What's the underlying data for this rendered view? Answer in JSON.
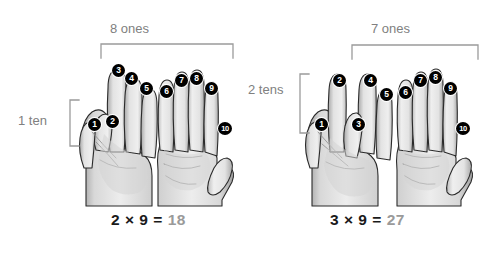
{
  "figure": {
    "background": "#ffffff",
    "label_color": "#808080",
    "equation_color": "#1a1a1a",
    "result_color": "#9a9a9a",
    "badge_color": "#000000",
    "badge_text_color": "#ffffff"
  },
  "panels": [
    {
      "id": "left",
      "tens_label": "1 ten",
      "ones_label": "8 ones",
      "equation": {
        "left_factor": "2",
        "operator": "×",
        "right_factor": "9",
        "equals": "=",
        "result": "18"
      },
      "badges": [
        {
          "n": "1",
          "x": 88,
          "y": 118
        },
        {
          "n": "2",
          "x": 106,
          "y": 115
        },
        {
          "n": "3",
          "x": 112,
          "y": 64
        },
        {
          "n": "4",
          "x": 125,
          "y": 72
        },
        {
          "n": "5",
          "x": 140,
          "y": 82
        },
        {
          "n": "6",
          "x": 160,
          "y": 85
        },
        {
          "n": "7",
          "x": 175,
          "y": 74
        },
        {
          "n": "8",
          "x": 190,
          "y": 72
        },
        {
          "n": "9",
          "x": 205,
          "y": 82
        },
        {
          "n": "10",
          "x": 218,
          "y": 122
        }
      ]
    },
    {
      "id": "right",
      "tens_label": "2 tens",
      "ones_label": "7 ones",
      "equation": {
        "left_factor": "3",
        "operator": "×",
        "right_factor": "9",
        "equals": "=",
        "result": "27"
      },
      "badges": [
        {
          "n": "1",
          "x": 315,
          "y": 118
        },
        {
          "n": "2",
          "x": 333,
          "y": 74
        },
        {
          "n": "3",
          "x": 352,
          "y": 118
        },
        {
          "n": "4",
          "x": 364,
          "y": 74
        },
        {
          "n": "5",
          "x": 380,
          "y": 88
        },
        {
          "n": "6",
          "x": 399,
          "y": 86
        },
        {
          "n": "7",
          "x": 414,
          "y": 74
        },
        {
          "n": "8",
          "x": 429,
          "y": 71
        },
        {
          "n": "9",
          "x": 444,
          "y": 82
        },
        {
          "n": "10",
          "x": 456,
          "y": 122
        }
      ]
    }
  ],
  "brackets": [
    {
      "name": "ones-bracket-left",
      "x1": 101,
      "x2": 233,
      "y": 44,
      "leg": 14
    },
    {
      "name": "ones-bracket-right",
      "x1": 352,
      "x2": 478,
      "y": 45,
      "leg": 14
    },
    {
      "name": "tens-bracket-left",
      "x": 70,
      "y1": 100,
      "y2": 146,
      "leg": 9
    },
    {
      "name": "tens-bracket-right",
      "x": 300,
      "y1": 74,
      "y2": 133,
      "leg": 9
    }
  ],
  "counts": {
    "left_folded_fingers": 2,
    "left_extended_fingers": 8,
    "right_folded_fingers": 3,
    "right_extended_fingers": 7
  }
}
